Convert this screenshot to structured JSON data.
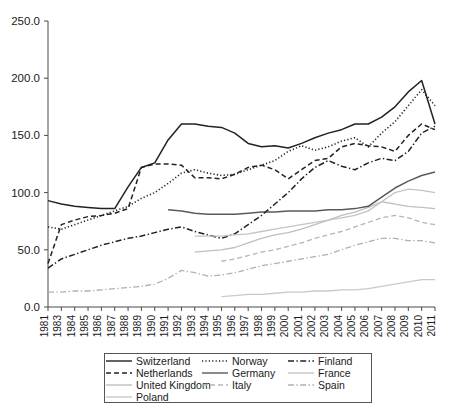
{
  "chart_data": {
    "type": "line",
    "title": "",
    "subtitle": "",
    "xlabel": "",
    "ylabel": "",
    "xlim": [
      1981,
      2011
    ],
    "ylim": [
      0.0,
      250.0
    ],
    "grid": false,
    "legend_position": "bottom",
    "y_ticks": [
      "0.0",
      "50.0",
      "100.0",
      "150.0",
      "200.0",
      "250.0"
    ],
    "y_tick_values": [
      0.0,
      50.0,
      100.0,
      150.0,
      200.0,
      250.0
    ],
    "x_tick_labels": [
      "1981",
      "1983",
      "1984",
      "1985",
      "1986",
      "1987",
      "1988",
      "1989",
      "1990",
      "1991",
      "1992",
      "1993",
      "1994",
      "1995",
      "1996",
      "1997",
      "1998",
      "1999",
      "2000",
      "2001",
      "2002",
      "2003",
      "2004",
      "2005",
      "2006",
      "2007",
      "2008",
      "2009",
      "2010",
      "2011"
    ],
    "x": [
      1981,
      1983,
      1984,
      1985,
      1986,
      1987,
      1988,
      1989,
      1990,
      1991,
      1992,
      1993,
      1994,
      1995,
      1996,
      1997,
      1998,
      1999,
      2000,
      2001,
      2002,
      2003,
      2004,
      2005,
      2006,
      2007,
      2008,
      2009,
      2010,
      2011
    ],
    "series": [
      {
        "name": "Switzerland",
        "style": "solid",
        "color": "#222222",
        "width": 1.5,
        "values": [
          93,
          90,
          88,
          87,
          86,
          86,
          105,
          122,
          126,
          146,
          160,
          160,
          158,
          157,
          152,
          143,
          140,
          141,
          139,
          143,
          148,
          152,
          155,
          160,
          160,
          166,
          175,
          188,
          198,
          160
        ]
      },
      {
        "name": "Netherlands",
        "style": "dashed",
        "color": "#222222",
        "width": 1.5,
        "values": [
          38,
          72,
          76,
          79,
          80,
          82,
          86,
          122,
          125,
          125,
          124,
          113,
          113,
          112,
          116,
          122,
          124,
          120,
          112,
          120,
          128,
          130,
          140,
          143,
          141,
          140,
          136,
          150,
          160,
          155
        ]
      },
      {
        "name": "United Kingdom",
        "style": "solid",
        "color": "#bfbfbf",
        "width": 1.3,
        "values": [
          null,
          null,
          null,
          null,
          null,
          null,
          null,
          null,
          null,
          null,
          null,
          48,
          49,
          50,
          52,
          56,
          60,
          63,
          65,
          68,
          72,
          76,
          80,
          83,
          87,
          92,
          90,
          88,
          87,
          86
        ]
      },
      {
        "name": "Poland",
        "style": "solid",
        "color": "#c9c9c9",
        "width": 1.3,
        "values": [
          null,
          null,
          null,
          null,
          null,
          null,
          null,
          null,
          null,
          null,
          null,
          null,
          null,
          9,
          10,
          11,
          11,
          12,
          13,
          13,
          14,
          14,
          15,
          15,
          16,
          18,
          20,
          22,
          24,
          24
        ]
      },
      {
        "name": "Norway",
        "style": "dotted",
        "color": "#222222",
        "width": 1.6,
        "values": [
          70,
          68,
          72,
          76,
          80,
          84,
          88,
          95,
          100,
          108,
          117,
          120,
          117,
          115,
          116,
          120,
          124,
          128,
          136,
          141,
          137,
          140,
          145,
          148,
          140,
          152,
          162,
          176,
          190,
          176
        ]
      },
      {
        "name": "Germany",
        "style": "solid",
        "color": "#5a5a5a",
        "width": 1.5,
        "values": [
          null,
          null,
          null,
          null,
          null,
          null,
          null,
          null,
          null,
          85,
          84,
          82,
          81,
          81,
          81,
          82,
          83,
          83,
          84,
          84,
          84,
          85,
          85,
          86,
          88,
          96,
          104,
          110,
          115,
          118
        ]
      },
      {
        "name": "Italy",
        "style": "dashed",
        "color": "#b5b5b5",
        "width": 1.3,
        "values": [
          null,
          null,
          null,
          null,
          null,
          null,
          null,
          null,
          null,
          null,
          null,
          null,
          null,
          40,
          42,
          45,
          48,
          50,
          53,
          56,
          60,
          63,
          66,
          70,
          74,
          78,
          80,
          78,
          74,
          72
        ]
      },
      {
        "name": "Finland",
        "style": "dashdot",
        "color": "#222222",
        "width": 1.5,
        "values": [
          34,
          42,
          46,
          50,
          54,
          57,
          60,
          62,
          65,
          68,
          70,
          66,
          63,
          60,
          64,
          72,
          80,
          90,
          100,
          112,
          122,
          128,
          123,
          120,
          126,
          130,
          128,
          136,
          152,
          158
        ]
      },
      {
        "name": "France",
        "style": "solid",
        "color": "#c4c4c4",
        "width": 1.3,
        "values": [
          null,
          null,
          null,
          null,
          null,
          null,
          null,
          null,
          null,
          null,
          null,
          62,
          62,
          62,
          63,
          64,
          66,
          68,
          70,
          72,
          74,
          76,
          78,
          80,
          84,
          92,
          100,
          103,
          102,
          100
        ]
      },
      {
        "name": "Spain",
        "style": "dashdot",
        "color": "#b0b0b0",
        "width": 1.3,
        "values": [
          13,
          13,
          14,
          14,
          15,
          16,
          17,
          18,
          20,
          25,
          32,
          30,
          27,
          28,
          30,
          33,
          36,
          38,
          40,
          42,
          44,
          46,
          50,
          54,
          57,
          60,
          60,
          58,
          58,
          56
        ]
      }
    ]
  },
  "legend": {
    "entries": [
      {
        "label": "Switzerland",
        "style": "solid",
        "color": "#222222"
      },
      {
        "label": "Norway",
        "style": "dotted",
        "color": "#222222"
      },
      {
        "label": "Finland",
        "style": "dashdot",
        "color": "#222222"
      },
      {
        "label": "Netherlands",
        "style": "dashed",
        "color": "#222222"
      },
      {
        "label": "Germany",
        "style": "solid",
        "color": "#5a5a5a"
      },
      {
        "label": "France",
        "style": "solid",
        "color": "#c4c4c4"
      },
      {
        "label": "United Kingdom",
        "style": "solid",
        "color": "#bfbfbf"
      },
      {
        "label": "Italy",
        "style": "dashed",
        "color": "#b5b5b5"
      },
      {
        "label": "Spain",
        "style": "dashdot",
        "color": "#b0b0b0"
      },
      {
        "label": "Poland",
        "style": "solid",
        "color": "#c9c9c9"
      }
    ]
  }
}
